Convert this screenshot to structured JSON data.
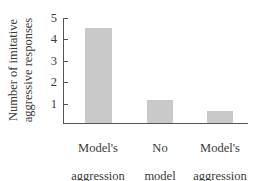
{
  "chart_data": {
    "type": "bar",
    "title": "",
    "xlabel": "",
    "ylabel": "Number of imitative aggressive responses",
    "ylabel_lines": [
      "Number of imitative",
      "aggressive responses"
    ],
    "categories": [
      "Model's aggression reinforced",
      "No model",
      "Model's aggression punished"
    ],
    "category_lines": [
      [
        "Model's",
        "aggression",
        "reinforced"
      ],
      [
        "No",
        "model"
      ],
      [
        "Model's",
        "aggression",
        "punished"
      ]
    ],
    "values": [
      4.5,
      1.1,
      0.55
    ],
    "yticks": [
      "1",
      "2",
      "3",
      "4",
      "5"
    ],
    "ylim": [
      0,
      5
    ],
    "grid": false,
    "legend": null,
    "bar_color": "#c9c9c9"
  }
}
